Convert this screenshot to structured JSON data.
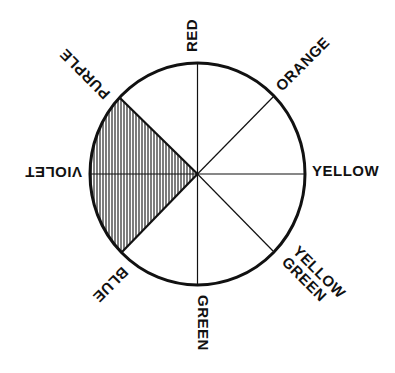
{
  "diagram": {
    "type": "color-wheel",
    "colors": {
      "ink": "#111111",
      "background": "#ffffff"
    },
    "labels": {
      "red": "RED",
      "orange": "ORANGE",
      "yellow": "YELLOW",
      "yellow_green_line1": "YELLOW",
      "yellow_green_line2": "GREEN",
      "green": "GREEN",
      "blue": "BLUE",
      "violet": "VIOLET",
      "purple": "PURPLE"
    },
    "segments": [
      "RED",
      "ORANGE",
      "YELLOW",
      "YELLOW GREEN",
      "GREEN",
      "BLUE",
      "VIOLET",
      "PURPLE"
    ],
    "highlighted_region": {
      "from": "PURPLE",
      "to": "BLUE",
      "contains": "VIOLET",
      "fill": "vertical-hatching"
    }
  }
}
